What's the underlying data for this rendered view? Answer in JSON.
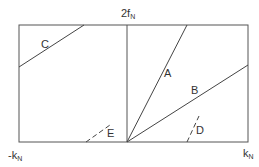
{
  "diagram": {
    "axis_top_label": "2f",
    "axis_top_sub": "N",
    "axis_left_label": "-k",
    "axis_left_sub": "N",
    "axis_right_label": "k",
    "axis_right_sub": "N",
    "lines": [
      {
        "label": "A",
        "style": "solid"
      },
      {
        "label": "B",
        "style": "solid"
      },
      {
        "label": "C",
        "style": "solid"
      },
      {
        "label": "D",
        "style": "dashed"
      },
      {
        "label": "E",
        "style": "dashed"
      }
    ],
    "colors": {
      "stroke": "#444444",
      "background": "#ffffff"
    }
  }
}
